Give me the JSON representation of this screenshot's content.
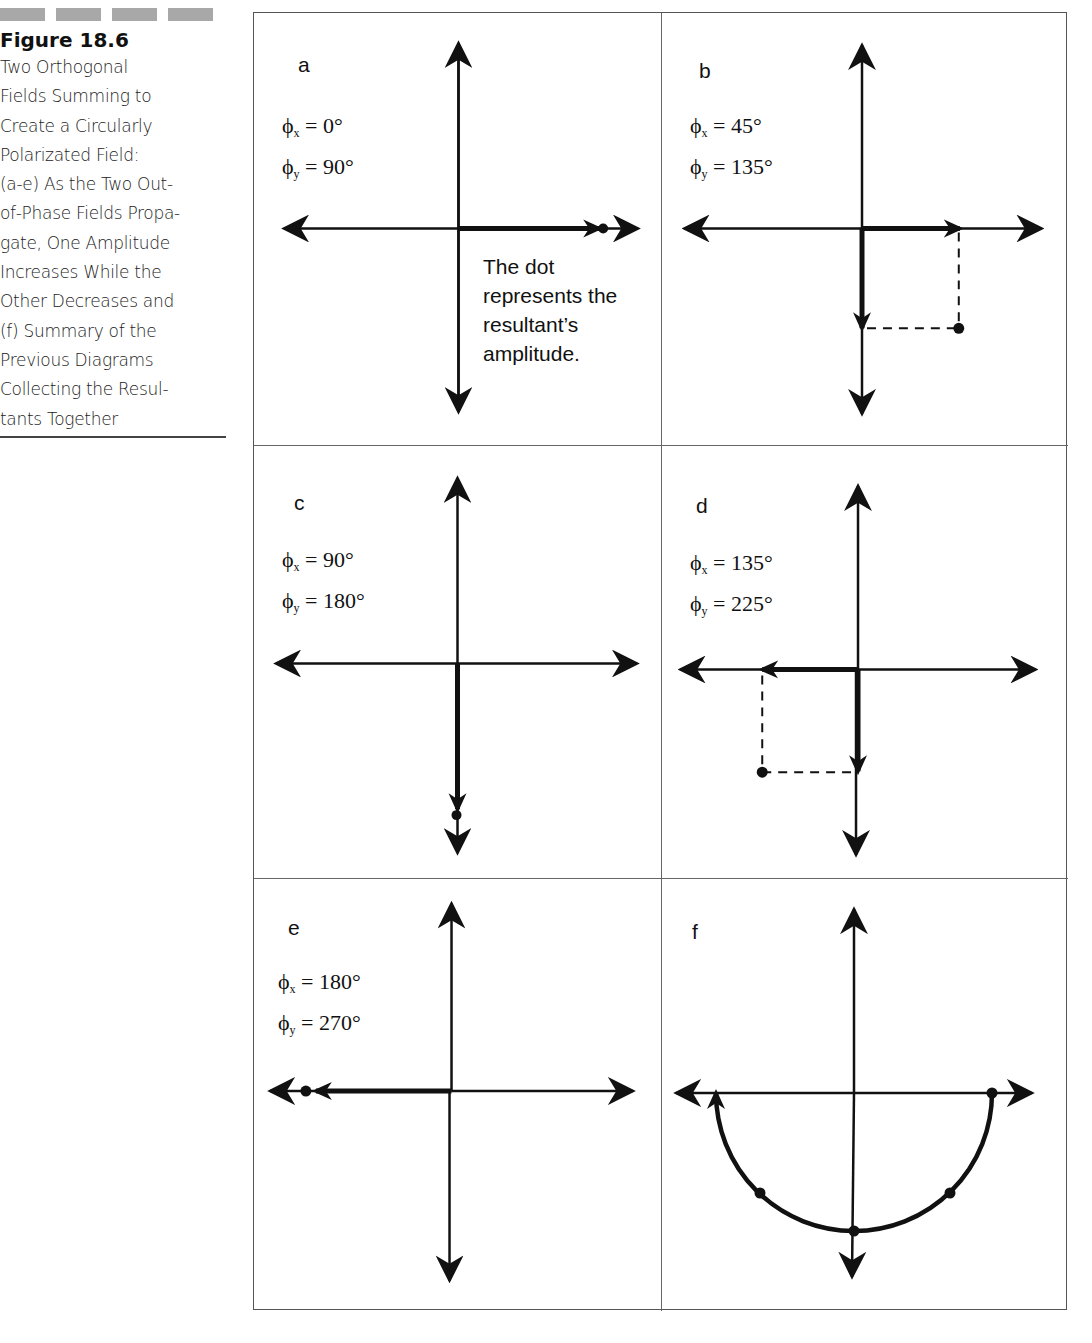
{
  "caption": {
    "figure_number": "Figure 18.6",
    "lines": [
      "Two Orthogonal",
      "Fields Summing to",
      "Create a Circularly",
      "Polarizated Field:",
      "(a-e) As the Two Out-",
      "of-Phase Fields Propa-",
      "gate, One Amplitude",
      "Increases While the",
      "Other Decreases and",
      "(f) Summary of the",
      "Previous Diagrams",
      "Collecting the Resul-",
      "tants Together"
    ]
  },
  "symbols": {
    "phi": "ϕ",
    "sub_x": "x",
    "sub_y": "y",
    "equals": " = "
  },
  "panels": [
    {
      "label": "a",
      "phi_x": "0°",
      "phi_y": "90°",
      "note": [
        "The dot",
        "represents the",
        "resultant’s",
        "amplitude."
      ]
    },
    {
      "label": "b",
      "phi_x": "45°",
      "phi_y": "135°"
    },
    {
      "label": "c",
      "phi_x": "90°",
      "phi_y": "180°"
    },
    {
      "label": "d",
      "phi_x": "135°",
      "phi_y": "225°"
    },
    {
      "label": "e",
      "phi_x": "180°",
      "phi_y": "270°"
    },
    {
      "label": "f"
    }
  ],
  "colors": {
    "ink": "#111111",
    "border": "#555555",
    "caption_bar": "#a8a8a8",
    "background": "#ffffff"
  }
}
